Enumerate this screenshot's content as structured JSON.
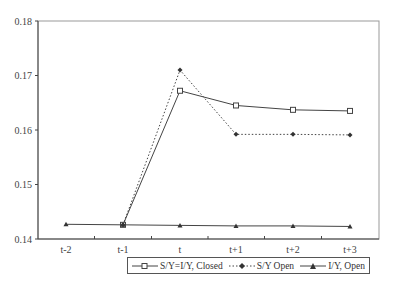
{
  "chart_data": {
    "type": "line",
    "title": "",
    "xlabel": "",
    "ylabel": "",
    "categories": [
      "t-2",
      "t-1",
      "t",
      "t+1",
      "t+2",
      "t+3"
    ],
    "yticks": [
      "0.14",
      "0.15",
      "0.16",
      "0.17",
      "0.18"
    ],
    "ylim": [
      0.14,
      0.18
    ],
    "grid": false,
    "legend_position": "bottom",
    "series": [
      {
        "name": "S/Y=I/Y, Closed",
        "marker": "open-square",
        "line": "solid",
        "values": [
          null,
          0.1426,
          0.1672,
          0.1645,
          0.1637,
          0.1635
        ]
      },
      {
        "name": "S/Y Open",
        "marker": "diamond",
        "line": "dotted",
        "values": [
          null,
          0.1426,
          0.171,
          0.1592,
          0.1592,
          0.1591
        ]
      },
      {
        "name": "I/Y, Open",
        "marker": "triangle",
        "line": "solid",
        "values": [
          0.1427,
          0.1426,
          0.1425,
          0.1424,
          0.1424,
          0.1423
        ]
      }
    ]
  },
  "legend": {
    "items": [
      {
        "label": "S/Y=I/Y, Closed"
      },
      {
        "label": "S/Y Open"
      },
      {
        "label": "I/Y, Open"
      }
    ]
  }
}
